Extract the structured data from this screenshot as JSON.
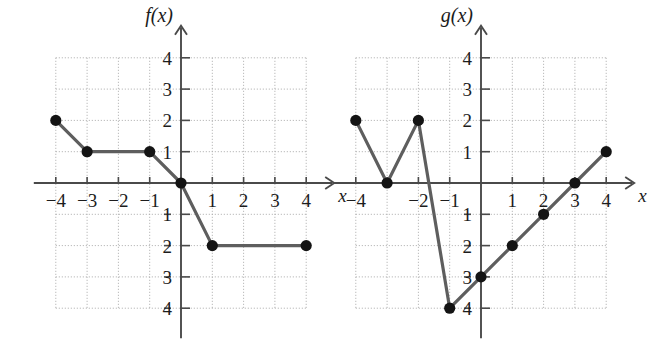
{
  "figure": {
    "background_color": "#ffffff",
    "axis_color": "#4a4a4a",
    "grid_color": "#a9a9a9",
    "curve_color": "#5e5e5e",
    "point_color": "#141414",
    "label_color": "#1c1c1c",
    "x_axis_label": "x",
    "minus_glyph": "−"
  },
  "chart_data": [
    {
      "id": "left",
      "type": "line",
      "title": "f(x)",
      "xlabel": "x",
      "ylabel": "f(x)",
      "xlim": [
        -4,
        4
      ],
      "ylim": [
        -4,
        4
      ],
      "grid": true,
      "grid_style": "dotted",
      "legend": "none",
      "x_ticks": [
        -4,
        -3,
        -2,
        -1,
        1,
        2,
        3,
        4
      ],
      "y_ticks": [
        -4,
        -3,
        -2,
        -1,
        1,
        2,
        3,
        4
      ],
      "x_tick_labels": [
        "−4",
        "−3",
        "−2",
        "−1",
        "1",
        "2",
        "3",
        "4"
      ],
      "y_tick_labels": [
        "−4",
        "−3",
        "−2",
        "−1",
        "1",
        "2",
        "3",
        "4"
      ],
      "x": [
        -4,
        -3,
        -1,
        0,
        1,
        4
      ],
      "values": [
        2,
        1,
        1,
        0,
        -2,
        -2
      ],
      "points": [
        {
          "x": -4,
          "y": 2
        },
        {
          "x": -3,
          "y": 1
        },
        {
          "x": -1,
          "y": 1
        },
        {
          "x": 0,
          "y": 0
        },
        {
          "x": 1,
          "y": -2
        },
        {
          "x": 4,
          "y": -2
        }
      ],
      "markers": "filled-circle"
    },
    {
      "id": "right",
      "type": "line",
      "title": "g(x)",
      "xlabel": "x",
      "ylabel": "g(x)",
      "xlim": [
        -4,
        4
      ],
      "ylim": [
        -4,
        4
      ],
      "grid": true,
      "grid_style": "dotted",
      "legend": "none",
      "x_ticks": [
        -4,
        -3,
        -2,
        -1,
        1,
        2,
        3,
        4
      ],
      "y_ticks": [
        -4,
        -3,
        -2,
        -1,
        1,
        2,
        3,
        4
      ],
      "x_tick_labels": [
        "−4",
        "",
        "−2",
        "−1",
        "1",
        "2",
        "3",
        "4"
      ],
      "y_tick_labels": [
        "−4",
        "−3",
        "−2",
        "−1",
        "1",
        "2",
        "3",
        "4"
      ],
      "x": [
        -4,
        -3,
        -2,
        -1,
        0,
        1,
        2,
        3,
        4
      ],
      "values": [
        2,
        0,
        2,
        -4,
        -3,
        -2,
        -1,
        0,
        1
      ],
      "points": [
        {
          "x": -4,
          "y": 2
        },
        {
          "x": -3,
          "y": 0
        },
        {
          "x": -2,
          "y": 2
        },
        {
          "x": -1,
          "y": -4
        },
        {
          "x": 0,
          "y": -3
        },
        {
          "x": 1,
          "y": -2
        },
        {
          "x": 2,
          "y": -1
        },
        {
          "x": 3,
          "y": 0
        },
        {
          "x": 4,
          "y": 1
        }
      ],
      "markers": "filled-circle"
    }
  ]
}
